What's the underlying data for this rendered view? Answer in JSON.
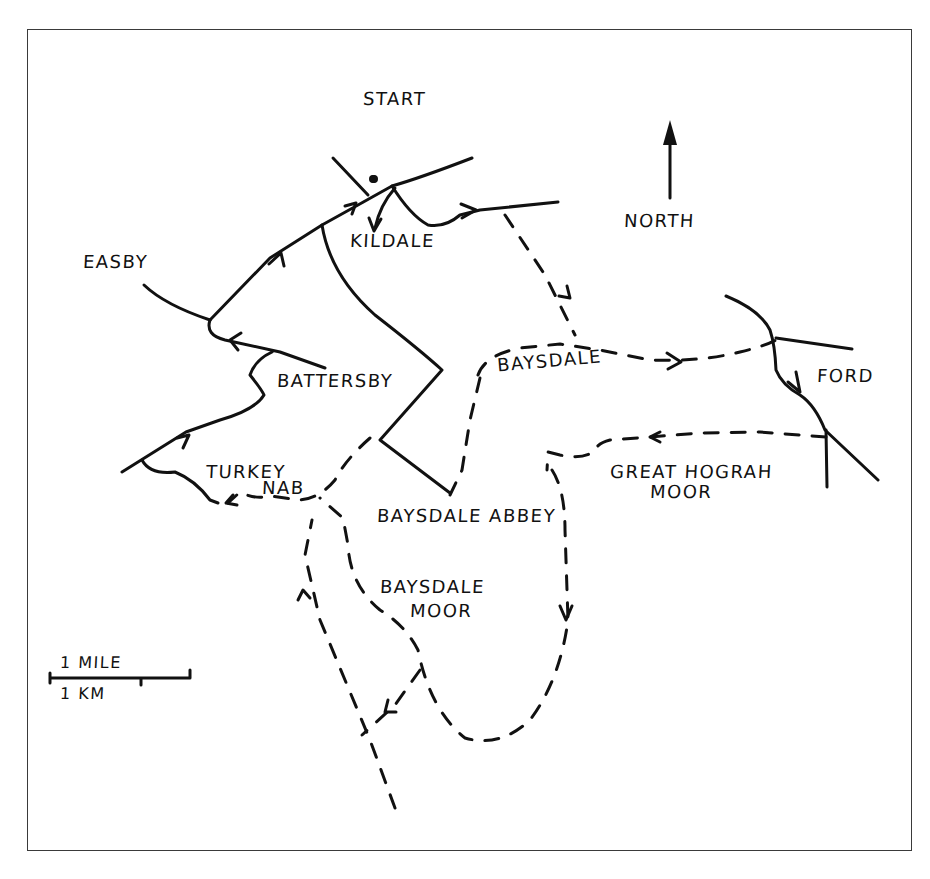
{
  "map": {
    "title": "Kildale – Baysdale circular walk",
    "colors": {
      "ink": "#111111",
      "paper": "#ffffff",
      "frame": "#3a3a3a"
    },
    "labels": {
      "start": "START",
      "north": "NORTH",
      "kildale": "KILDALE",
      "easby": "EASBY",
      "baysdale": "BAYSDALE",
      "ford": "FORD",
      "battersby": "BATTERSBY",
      "turkey_nab_line1": "TURKEY",
      "turkey_nab_line2": "NAB",
      "great_hograh_line1": "GREAT HOGRAH",
      "great_hograh_line2": "MOOR",
      "baysdale_abbey": "BAYSDALE ABBEY",
      "baysdale_moor_line1": "BAYSDALE",
      "baysdale_moor_line2": "MOOR"
    },
    "scale": {
      "miles_label": "1 MILE",
      "km_label": "1 KM"
    },
    "legend_icons": {
      "north_arrow": "north-arrow-icon",
      "start_marker": "start-marker-icon"
    }
  }
}
